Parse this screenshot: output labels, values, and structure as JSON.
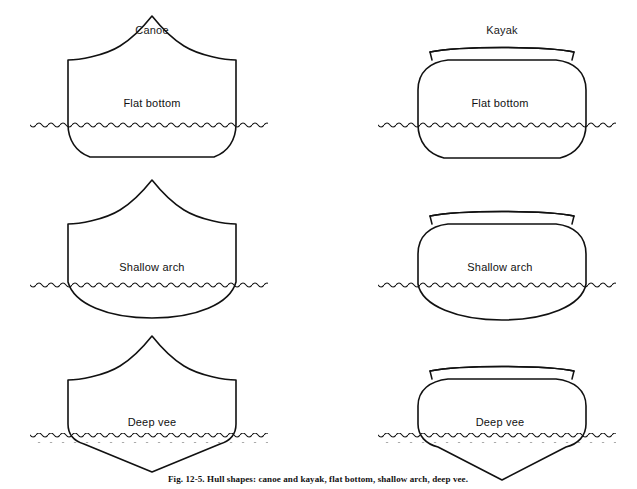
{
  "figure": {
    "caption": "Fig. 12-5. Hull shapes: canoe and kayak, flat bottom, shallow arch, deep vee.",
    "columns": [
      {
        "id": "canoe",
        "label": "Canoe",
        "center_x": 152
      },
      {
        "id": "kayak",
        "label": "Kayak",
        "center_x": 502
      }
    ],
    "rows": [
      {
        "id": "flat-bottom",
        "label": "Flat bottom",
        "center_y": 104
      },
      {
        "id": "shallow-arch",
        "label": "Shallow arch",
        "center_y": 268
      },
      {
        "id": "deep-vee",
        "label": "Deep vee",
        "center_y": 423
      }
    ],
    "cells": [
      {
        "id": "canoe-flat-bottom",
        "column": "Canoe",
        "row": "Flat bottom",
        "label": "Flat bottom",
        "label_x": 152,
        "label_y": 104
      },
      {
        "id": "kayak-flat-bottom",
        "column": "Kayak",
        "row": "Flat bottom",
        "label": "Flat bottom",
        "label_x": 500,
        "label_y": 104
      },
      {
        "id": "canoe-shallow-arch",
        "column": "Canoe",
        "row": "Shallow arch",
        "label": "Shallow arch",
        "label_x": 152,
        "label_y": 268
      },
      {
        "id": "kayak-shallow-arch",
        "column": "Kayak",
        "row": "Shallow arch",
        "label": "Shallow arch",
        "label_x": 500,
        "label_y": 268
      },
      {
        "id": "canoe-deep-vee",
        "column": "Canoe",
        "row": "Deep vee",
        "label": "Deep vee",
        "label_x": 152,
        "label_y": 423
      },
      {
        "id": "kayak-deep-vee",
        "column": "Kayak",
        "row": "Deep vee",
        "label": "Deep vee",
        "label_x": 500,
        "label_y": 423
      }
    ],
    "waterlines": [
      {
        "id": "waterline-canoe-flat",
        "x1": 30,
        "x2": 268,
        "y": 123
      },
      {
        "id": "waterline-kayak-flat",
        "x1": 378,
        "x2": 616,
        "y": 123
      },
      {
        "id": "waterline-canoe-arch",
        "x1": 30,
        "x2": 268,
        "y": 287
      },
      {
        "id": "waterline-kayak-arch",
        "x1": 378,
        "x2": 616,
        "y": 287
      },
      {
        "id": "waterline-canoe-vee",
        "x1": 30,
        "x2": 268,
        "y": 438
      },
      {
        "id": "waterline-kayak-vee",
        "x1": 378,
        "x2": 616,
        "y": 438
      }
    ],
    "colors": {
      "ink": "#111111",
      "background": "#ffffff"
    }
  }
}
